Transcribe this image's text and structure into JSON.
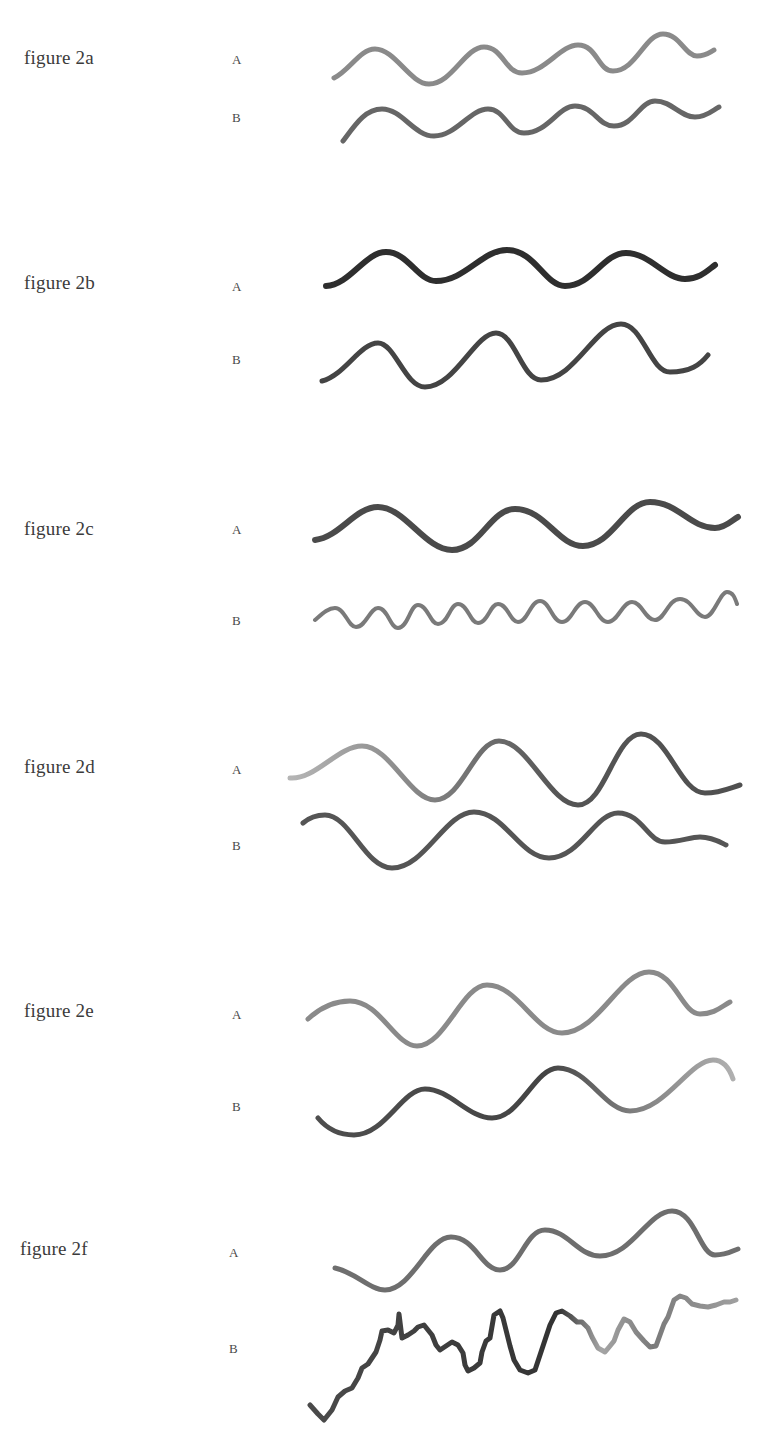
{
  "figures": [
    {
      "id": "2a",
      "label": "figure 2a",
      "rows": [
        {
          "label": "A",
          "stroke": "#8a8a8a",
          "width": 5,
          "description": "regular sine wave, ~4 cycles, light grey"
        },
        {
          "label": "B",
          "stroke": "#6a6a6a",
          "width": 5,
          "description": "regular sine wave, ~4 cycles, darker grey, smaller amplitude"
        }
      ]
    },
    {
      "id": "2b",
      "label": "figure 2b",
      "rows": [
        {
          "label": "A",
          "stroke": "#2e2e2e",
          "width": 6,
          "description": "sine wave, ~3 cycles, dark, low amplitude"
        },
        {
          "label": "B",
          "stroke": "#454545",
          "width": 5,
          "description": "sine wave, ~3 cycles, dark, higher amplitude"
        }
      ]
    },
    {
      "id": "2c",
      "label": "figure 2c",
      "rows": [
        {
          "label": "A",
          "stroke": "#4a4a4a",
          "width": 6,
          "description": "sine wave, ~3 cycles, dark grey"
        },
        {
          "label": "B",
          "stroke": "#7a7a7a",
          "width": 4,
          "description": "high-frequency small sine wave, ~11 cycles"
        }
      ]
    },
    {
      "id": "2d",
      "label": "figure 2d",
      "rows": [
        {
          "label": "A",
          "stroke": "#5a5a5a",
          "width": 5,
          "description": "sine wave, ~3 cycles, fading light at start"
        },
        {
          "label": "B",
          "stroke": "#555555",
          "width": 5,
          "description": "sine wave, ~3 cycles, phase-shifted"
        }
      ]
    },
    {
      "id": "2e",
      "label": "figure 2e",
      "rows": [
        {
          "label": "A",
          "stroke": "#8a8a8a",
          "width": 5,
          "description": "sine wave, ~2.5 cycles, light grey"
        },
        {
          "label": "B",
          "stroke": "#555555",
          "width": 5,
          "description": "sine wave, ~2.5 cycles, dark fading to light at end"
        }
      ]
    },
    {
      "id": "2f",
      "label": "figure 2f",
      "rows": [
        {
          "label": "A",
          "stroke": "#6e6e6e",
          "width": 5,
          "description": "regular sine wave, ~3 cycles"
        },
        {
          "label": "B",
          "stroke": "#4a4a4a",
          "width": 5,
          "description": "irregular jagged noisy line rising left to right"
        }
      ]
    }
  ]
}
